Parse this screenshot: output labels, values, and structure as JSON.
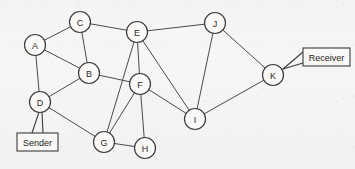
{
  "diagram": {
    "stroke_color": "#4a4a4a",
    "node_fill": "#faf9f7",
    "background_color": "#f7f6f4",
    "nodes": [
      {
        "id": "A",
        "label": "A",
        "x": 35,
        "y": 45,
        "r": 10.5
      },
      {
        "id": "B",
        "label": "B",
        "x": 89,
        "y": 73,
        "r": 10.5
      },
      {
        "id": "C",
        "label": "C",
        "x": 80,
        "y": 22,
        "r": 10.5
      },
      {
        "id": "D",
        "label": "D",
        "x": 40,
        "y": 102,
        "r": 10.5
      },
      {
        "id": "E",
        "label": "E",
        "x": 137,
        "y": 32,
        "r": 10.5
      },
      {
        "id": "F",
        "label": "F",
        "x": 140,
        "y": 84,
        "r": 10.5
      },
      {
        "id": "G",
        "label": "G",
        "x": 104,
        "y": 142,
        "r": 10.5
      },
      {
        "id": "H",
        "label": "H",
        "x": 145,
        "y": 148,
        "r": 10.5
      },
      {
        "id": "I",
        "label": "I",
        "x": 195,
        "y": 119,
        "r": 10.5
      },
      {
        "id": "J",
        "label": "J",
        "x": 215,
        "y": 23,
        "r": 10.5
      },
      {
        "id": "K",
        "label": "K",
        "x": 273,
        "y": 75,
        "r": 10.5
      }
    ],
    "edges": [
      {
        "from": "A",
        "to": "C"
      },
      {
        "from": "A",
        "to": "B"
      },
      {
        "from": "A",
        "to": "D"
      },
      {
        "from": "C",
        "to": "B"
      },
      {
        "from": "C",
        "to": "E"
      },
      {
        "from": "B",
        "to": "D"
      },
      {
        "from": "B",
        "to": "F"
      },
      {
        "from": "D",
        "to": "G"
      },
      {
        "from": "E",
        "to": "F"
      },
      {
        "from": "E",
        "to": "G"
      },
      {
        "from": "E",
        "to": "I"
      },
      {
        "from": "E",
        "to": "J"
      },
      {
        "from": "F",
        "to": "G"
      },
      {
        "from": "F",
        "to": "H"
      },
      {
        "from": "F",
        "to": "I"
      },
      {
        "from": "G",
        "to": "H"
      },
      {
        "from": "I",
        "to": "J"
      },
      {
        "from": "I",
        "to": "K"
      },
      {
        "from": "J",
        "to": "K"
      }
    ],
    "callouts": [
      {
        "id": "sender",
        "label": "Sender",
        "box": {
          "x": 17,
          "y": 133,
          "width": 41,
          "height": 18
        },
        "attached_node": "D",
        "leaders": [
          {
            "x1": 32,
            "y1": 133,
            "x2": 39,
            "y2": 112
          },
          {
            "x1": 43,
            "y1": 133,
            "x2": 42,
            "y2": 112
          }
        ]
      },
      {
        "id": "receiver",
        "label": "Receiver",
        "box": {
          "x": 303,
          "y": 48,
          "width": 47,
          "height": 18
        },
        "attached_node": "K",
        "leaders": [
          {
            "x1": 303,
            "y1": 52,
            "x2": 283,
            "y2": 69
          },
          {
            "x1": 303,
            "y1": 63,
            "x2": 283,
            "y2": 69
          }
        ]
      }
    ]
  }
}
